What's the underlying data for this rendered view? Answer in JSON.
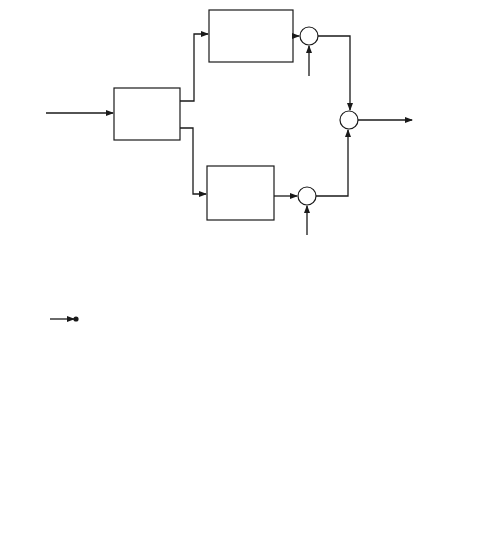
{
  "figure": {
    "label_partial": "Figure",
    "panel_a": {
      "caption": "(a)",
      "input_label": [
        "Binary",
        "data"
      ],
      "serial_to_parallel": [
        "Serial-",
        "to-parallel",
        "converter"
      ],
      "upper_converter": [
        "2-to-L",
        "converter"
      ],
      "lower_converter": [
        "2-to-L",
        "converter"
      ],
      "multiplier_symbol": "×",
      "upper_carrier": "cos(2πf",
      "upper_carrier_sub": "c",
      "upper_carrier_end": "t)",
      "lower_carrier": "sin(2πf",
      "lower_carrier_sub": "c",
      "lower_carrier_end": "t)",
      "summer_symbol": "Σ",
      "output_label": [
        "M-ary QAM",
        "wave"
      ]
    },
    "panel_b": {
      "caption": "(b)",
      "input_label": [
        "Received",
        "signal"
      ],
      "multiplier_symbol": "×",
      "upper_carrier": "cos(2πf",
      "upper_carrier_sub": "c",
      "upper_carrier_end": "t)",
      "lower_carrier": "sin(2πf",
      "lower_carrier_sub": "c",
      "lower_carrier_end": "t)",
      "integrator": {
        "sign": "∫",
        "upper_limit": "T",
        "lower_limit": "0",
        "differential": "dt"
      },
      "upper_decision": [
        "Decision",
        "circuit"
      ],
      "lower_decision": [
        "Decision",
        "circuit"
      ],
      "thresholds_label": "(L-1) thresholds",
      "parallel_to_serial": [
        "Parallel-",
        "to-serial",
        "converter"
      ],
      "output_label": [
        "Demodulated",
        "binary",
        "data"
      ]
    }
  }
}
